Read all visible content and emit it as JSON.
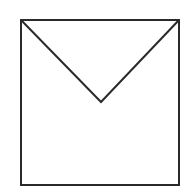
{
  "diagram": {
    "shape": "envelope",
    "stroke_color": "#2a2a2a",
    "background": "#ffffff",
    "square": {
      "x1": 21,
      "y1": 20,
      "x2": 179,
      "y2": 185
    },
    "apex": {
      "x": 101,
      "y": 102
    }
  }
}
